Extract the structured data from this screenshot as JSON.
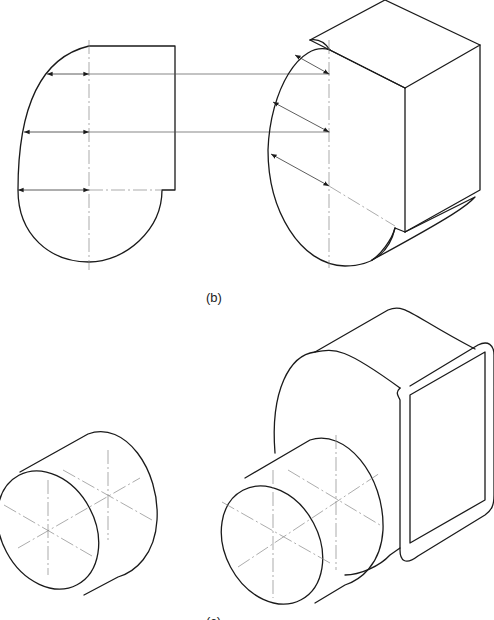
{
  "figure": {
    "labels": {
      "b": "(b)",
      "c": "(c)"
    },
    "parts": [
      "orthographic-profile-view",
      "isometric-duct-body-with-profile",
      "isometric-cylinder",
      "isometric-assembled-duct"
    ],
    "colors": {
      "line": "#1a1a1a",
      "centerline": "#888888",
      "background": "#ffffff"
    }
  }
}
